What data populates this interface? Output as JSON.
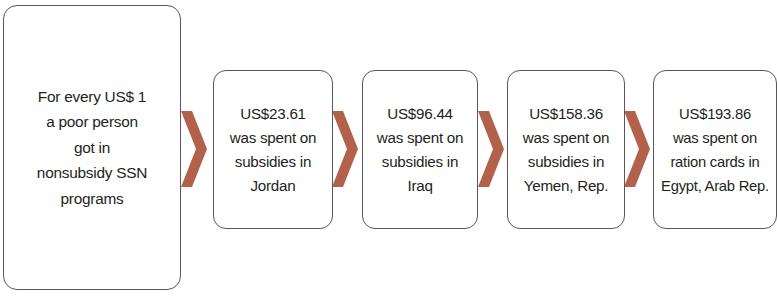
{
  "diagram": {
    "type": "horizontal-flow-chevron",
    "accent_color": "#b2624a",
    "node_border_color": "#58585a",
    "node_fill_color": "#ffffff",
    "text_color": "#231f20",
    "lead": {
      "lines": [
        "For every US$ 1",
        "a poor person",
        "got in",
        "nonsubsidy SSN",
        "programs"
      ]
    },
    "steps": [
      {
        "amount": "US$23.61",
        "lines": [
          "US$23.61",
          "was spent on",
          "subsidies in",
          "Jordan"
        ]
      },
      {
        "amount": "US$96.44",
        "lines": [
          "US$96.44",
          "was spent on",
          "subsidies in",
          "Iraq"
        ]
      },
      {
        "amount": "US$158.36",
        "lines": [
          "US$158.36",
          "was spent on",
          "subsidies in",
          "Yemen, Rep."
        ]
      },
      {
        "amount": "US$193.86",
        "lines": [
          "US$193.86",
          "was spent on",
          "ration cards in",
          "Egypt, Arab Rep."
        ]
      }
    ],
    "connectors": [
      {
        "name": "chevron-arrow-1"
      },
      {
        "name": "chevron-arrow-2"
      },
      {
        "name": "chevron-arrow-3"
      },
      {
        "name": "chevron-arrow-4"
      }
    ]
  }
}
